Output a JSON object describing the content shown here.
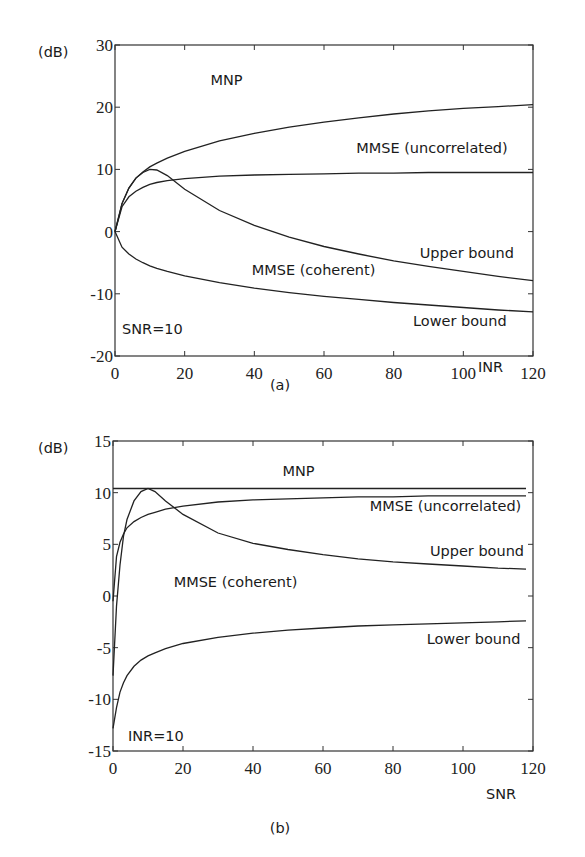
{
  "chart_data": [
    {
      "id": "a",
      "type": "line",
      "caption": "(a)",
      "ylabel": "(dB)",
      "xlabel": "INR",
      "annotation": "SNR=10",
      "xlim": [
        0,
        120
      ],
      "ylim": [
        -20,
        30
      ],
      "xticks": [
        0,
        20,
        40,
        60,
        80,
        100,
        120
      ],
      "yticks": [
        -20,
        -10,
        0,
        10,
        20,
        30
      ],
      "grid": false,
      "x": [
        0,
        2,
        4,
        6,
        8,
        10,
        12,
        15,
        20,
        30,
        40,
        50,
        60,
        70,
        80,
        90,
        100,
        110,
        120
      ],
      "series": [
        {
          "name": "MNP",
          "values": [
            0,
            4.5,
            7.0,
            8.6,
            9.6,
            10.4,
            11.0,
            11.8,
            12.9,
            14.6,
            15.8,
            16.8,
            17.6,
            18.3,
            18.9,
            19.4,
            19.8,
            20.1,
            20.4
          ]
        },
        {
          "name": "MMSE (uncorrelated)",
          "values": [
            0,
            4.0,
            5.6,
            6.5,
            7.1,
            7.6,
            7.9,
            8.2,
            8.5,
            8.9,
            9.1,
            9.2,
            9.3,
            9.4,
            9.4,
            9.5,
            9.5,
            9.5,
            9.5
          ]
        },
        {
          "name": "Upper bound",
          "values": [
            0,
            4.5,
            7.0,
            8.6,
            9.5,
            10.0,
            9.9,
            9.0,
            6.8,
            3.4,
            1.0,
            -0.9,
            -2.4,
            -3.6,
            -4.7,
            -5.6,
            -6.4,
            -7.2,
            -7.9
          ]
        },
        {
          "name": "MMSE (coherent) / Lower bound",
          "values": [
            0,
            -2.5,
            -3.6,
            -4.4,
            -5.0,
            -5.5,
            -5.9,
            -6.4,
            -7.1,
            -8.2,
            -9.1,
            -9.8,
            -10.4,
            -10.9,
            -11.4,
            -11.8,
            -12.2,
            -12.6,
            -12.9
          ]
        }
      ],
      "labels": [
        {
          "text": "MNP",
          "x": 32,
          "y": 23.5
        },
        {
          "text": "MMSE (uncorrelated)",
          "x": 91,
          "y": 12.6
        },
        {
          "text": "Upper bound",
          "x": 101,
          "y": -4.2
        },
        {
          "text": "MMSE (coherent)",
          "x": 57,
          "y": -6.9
        },
        {
          "text": "Lower bound",
          "x": 99,
          "y": -15.2
        }
      ]
    },
    {
      "id": "b",
      "type": "line",
      "caption": "(b)",
      "ylabel": "(dB)",
      "xlabel": "SNR",
      "annotation": "INR=10",
      "xlim": [
        0,
        120
      ],
      "ylim": [
        -15,
        15
      ],
      "xticks": [
        0,
        20,
        40,
        60,
        80,
        100,
        120
      ],
      "yticks": [
        -15,
        -10,
        -5,
        0,
        5,
        10,
        15
      ],
      "grid": false,
      "x": [
        0,
        1,
        2,
        3,
        4,
        6,
        8,
        10,
        12,
        15,
        20,
        30,
        40,
        50,
        60,
        70,
        80,
        90,
        100,
        110,
        118
      ],
      "series": [
        {
          "name": "MNP",
          "values": [
            10.4,
            10.4,
            10.4,
            10.4,
            10.4,
            10.4,
            10.4,
            10.4,
            10.4,
            10.4,
            10.4,
            10.4,
            10.4,
            10.4,
            10.4,
            10.4,
            10.4,
            10.4,
            10.4,
            10.4,
            10.4
          ]
        },
        {
          "name": "MMSE (uncorrelated)",
          "values": [
            -0.5,
            3.8,
            5.2,
            6.0,
            6.6,
            7.2,
            7.6,
            7.9,
            8.1,
            8.4,
            8.7,
            9.1,
            9.3,
            9.4,
            9.5,
            9.6,
            9.6,
            9.7,
            9.7,
            9.7,
            9.7
          ]
        },
        {
          "name": "Upper bound",
          "values": [
            -7.7,
            -1.0,
            3.0,
            5.8,
            7.4,
            9.2,
            10.1,
            10.4,
            10.1,
            9.2,
            7.9,
            6.1,
            5.1,
            4.5,
            4.0,
            3.6,
            3.3,
            3.1,
            2.9,
            2.7,
            2.6
          ]
        },
        {
          "name": "Lower bound",
          "values": [
            -12.8,
            -10.8,
            -9.3,
            -8.4,
            -7.7,
            -6.8,
            -6.2,
            -5.8,
            -5.5,
            -5.1,
            -4.6,
            -4.0,
            -3.6,
            -3.3,
            -3.1,
            -2.9,
            -2.8,
            -2.7,
            -2.6,
            -2.5,
            -2.4
          ]
        }
      ],
      "labels": [
        {
          "text": "MNP",
          "x": 53,
          "y": 11.6
        },
        {
          "text": "MMSE (uncorrelated)",
          "x": 95,
          "y": 8.2
        },
        {
          "text": "Upper bound",
          "x": 104,
          "y": 3.9
        },
        {
          "text": "MMSE (coherent)",
          "x": 35,
          "y": 0.9
        },
        {
          "text": "Lower bound",
          "x": 103,
          "y": -4.6
        }
      ]
    }
  ]
}
